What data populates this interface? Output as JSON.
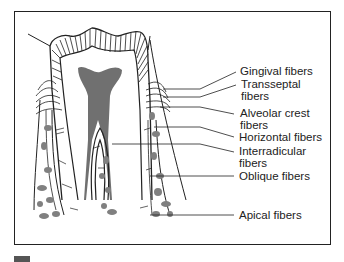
{
  "figure": {
    "labels": [
      {
        "id": "gingival",
        "text": "Gingival fibers"
      },
      {
        "id": "transseptal",
        "text": "Transseptal\nfibers",
        "line1": "Transseptal",
        "line2": "fibers"
      },
      {
        "id": "alveolar-crest",
        "text": "Alveolar crest\nfibers",
        "line1": "Alveolar crest",
        "line2": "fibers"
      },
      {
        "id": "horizontal",
        "text": "Horizontal fibers"
      },
      {
        "id": "interradicular",
        "text": "Interradicular\nfibers",
        "line1": "Interradicular",
        "line2": "fibers"
      },
      {
        "id": "oblique",
        "text": "Oblique fibers"
      },
      {
        "id": "apical",
        "text": "Apical fibers"
      }
    ],
    "colors": {
      "line": "#222222",
      "pulp": "#707070",
      "bone": "#808080",
      "background": "#ffffff"
    }
  }
}
